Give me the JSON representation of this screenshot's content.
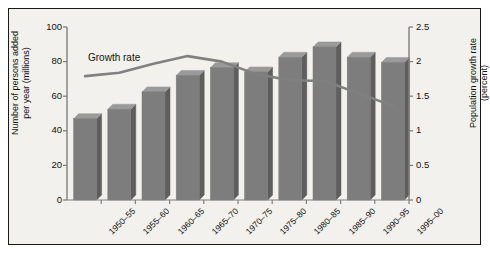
{
  "chart_data": {
    "type": "bar",
    "title": "",
    "subtitle": "",
    "xlabel": "",
    "categories": [
      "1950–55",
      "1955–60",
      "1960–65",
      "1965–70",
      "1970–75",
      "1975–80",
      "1980–85",
      "1985–90",
      "1990–95",
      "1995–00"
    ],
    "series": [
      {
        "name": "Number of persons added per year (millions)",
        "type": "bar",
        "axis": "left",
        "values": [
          47,
          52.5,
          62.5,
          72,
          76.5,
          74,
          82.5,
          88.5,
          82.5,
          79.5
        ]
      },
      {
        "name": "Growth rate",
        "type": "line",
        "axis": "right",
        "values": [
          1.79,
          1.84,
          1.97,
          2.08,
          2.0,
          1.82,
          1.73,
          1.72,
          1.54,
          1.36
        ]
      }
    ],
    "left_axis": {
      "label_line1": "Number of persons added",
      "label_line2": "per year (millions)",
      "ticks": [
        "0",
        "20",
        "40",
        "60",
        "80",
        "100"
      ],
      "tick_values": [
        0,
        20,
        40,
        60,
        80,
        100
      ],
      "ylim": [
        0,
        100
      ]
    },
    "right_axis": {
      "label_line1": "Population growth rate",
      "label_line2": "(percent)",
      "ticks": [
        "0",
        "0.5",
        "1",
        "1.5",
        "2",
        "2.5"
      ],
      "tick_values": [
        0,
        0.5,
        1,
        1.5,
        2,
        2.5
      ],
      "ylim": [
        0,
        2.5
      ]
    },
    "annotations": [
      {
        "name": "growth-rate-label",
        "text": "Growth rate"
      }
    ],
    "legend": {
      "position": "inline-annotation",
      "entries": [
        "Growth rate"
      ]
    },
    "grid": false,
    "colors": {
      "bar_face": "#7d7d7d",
      "bar_side": "#5e5e5e",
      "bar_top": "#9a9a9a",
      "line": "#808080",
      "axis": "#808080",
      "frame": "#1a1a1a",
      "background": "#f2f1ee",
      "text": "#111111"
    }
  }
}
